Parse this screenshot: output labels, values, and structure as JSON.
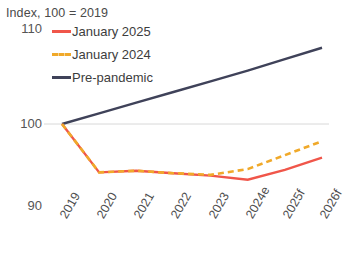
{
  "chart_data": {
    "type": "line",
    "title": "Index, 100 = 2019",
    "xlabel": "",
    "ylabel": "",
    "categories": [
      "2019",
      "2020",
      "2021",
      "2022",
      "2023",
      "2024e",
      "2025f",
      "2026f"
    ],
    "ylim": [
      90,
      110
    ],
    "yticks": [
      110,
      100,
      90
    ],
    "grid": "horizontal-at-100",
    "legend_position": "top-left",
    "series": [
      {
        "name": "January 2025",
        "color": "#f0564a",
        "style": "solid",
        "values": [
          100.0,
          94.1,
          94.3,
          94.0,
          93.7,
          93.2,
          94.4,
          95.9
        ]
      },
      {
        "name": "January 2024",
        "color": "#f0a92a",
        "style": "dashed",
        "values": [
          100.0,
          94.1,
          94.3,
          94.0,
          93.8,
          94.5,
          96.2,
          97.9
        ]
      },
      {
        "name": "Pre-pandemic",
        "color": "#3f4259",
        "style": "solid",
        "values": [
          100.0,
          101.3,
          102.6,
          103.9,
          105.2,
          106.5,
          107.9,
          109.3
        ]
      }
    ]
  },
  "colors": {
    "january_2025": "#f0564a",
    "january_2024": "#f0a92a",
    "pre_pandemic": "#3f4259",
    "gridline": "#d8d8d8",
    "text": "#4a4a4a",
    "background": "#ffffff"
  }
}
